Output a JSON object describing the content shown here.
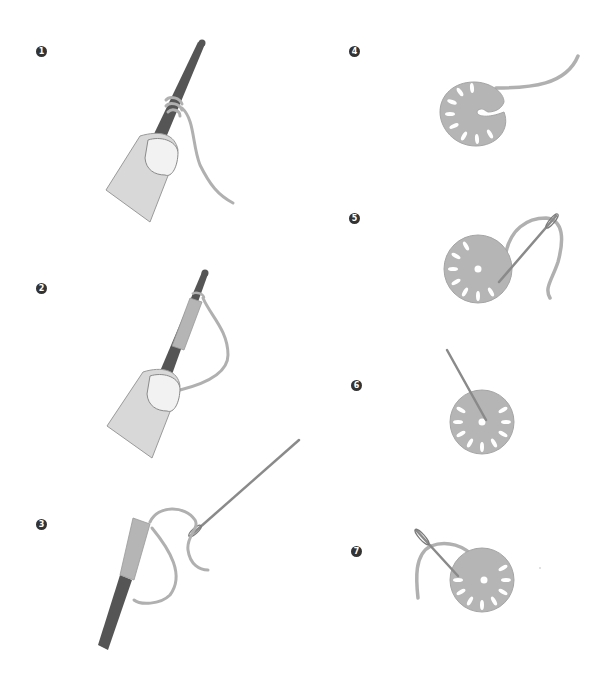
{
  "title": "",
  "colors": {
    "background": "#ffffff",
    "badge": "#333333",
    "badge_text": "#ffffff",
    "hook": "#555555",
    "finger": "#d8d8d8",
    "finger_outline": "#9a9a9a",
    "nail": "#f0f0f0",
    "yarn": "#b5b5b5",
    "yarn_dark": "#999999",
    "needle": "#8a8a8a"
  },
  "steps": [
    {
      "number": "1",
      "description": "finger holding hook with yarn looped around hook"
    },
    {
      "number": "2",
      "description": "finger holding hook with yarn wrapped into a coil"
    },
    {
      "number": "3",
      "description": "coil slid off hook; yarn end threaded into needle"
    },
    {
      "number": "4",
      "description": "coil curled into a partial rosette with trailing yarn"
    },
    {
      "number": "5",
      "description": "needle passing through rosette to close ring"
    },
    {
      "number": "6",
      "description": "needle inserted through center of rosette"
    },
    {
      "number": "7",
      "description": "needle weaving in yarn end at back of rosette"
    }
  ]
}
